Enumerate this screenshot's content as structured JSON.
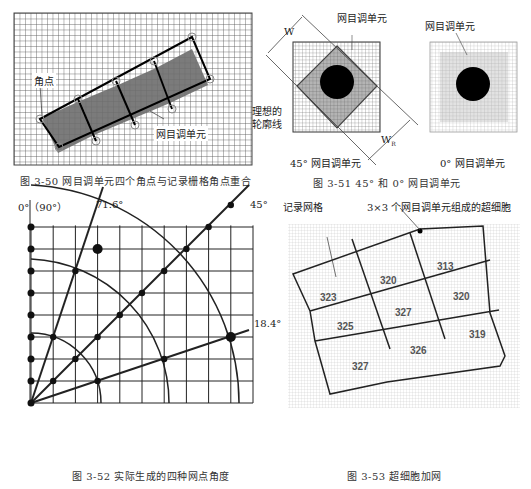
{
  "fig_3_50": {
    "caption": "图 3-50   网目调单元四个角点与记录栅格角点重合",
    "label_corner": "角点",
    "label_cell": "网目调单元"
  },
  "fig_3_51": {
    "caption": "图 3-51   45° 和 0° 网目调单元",
    "left": {
      "label_cell": "网目调单元",
      "label_w": "W",
      "label_wr": "W",
      "label_wr_sub": "R",
      "label_outline_1": "理想的",
      "label_outline_2": "轮廓线",
      "sublabel": "45° 网目调单元"
    },
    "right": {
      "label_cell": "网目调单元",
      "sublabel": "0° 网目调单元"
    }
  },
  "fig_3_52": {
    "caption": "图 3-52   实际生成的四种网点角度",
    "angle_0_90": "0°（90°）",
    "angle_71_6": "71.6°",
    "angle_45": "45°",
    "angle_18_4": "18.4°"
  },
  "fig_3_53": {
    "caption": "图 3-53   超细胞加网",
    "label_grid": "记录网格",
    "label_supercell": "3×3 个网目调单元组成的超细胞",
    "cell_values": [
      "323",
      "320",
      "313",
      "325",
      "327",
      "320",
      "327",
      "326",
      "319"
    ]
  }
}
